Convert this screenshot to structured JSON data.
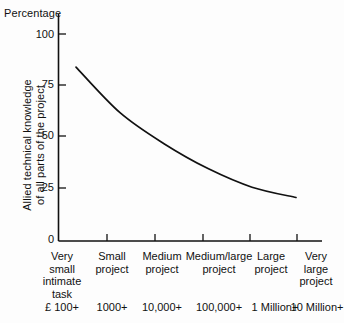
{
  "chart_data": {
    "type": "line",
    "title": "",
    "ylabel": "Allied technical knowledge of all parts of the project",
    "ylabel_lines": [
      "Allied technical knowledge",
      "of all parts of the project"
    ],
    "yunit_caption": "Percentage",
    "xlabel": "",
    "ylim": [
      0,
      100
    ],
    "yticks": [
      0,
      25,
      50,
      75,
      100
    ],
    "ytick_labels": [
      "0",
      "25",
      "50",
      "75",
      "100"
    ],
    "grid": false,
    "legend": "none",
    "categories": [
      "Very small intimate task",
      "Small project",
      "Medium project",
      "Medium/large project",
      "Large project",
      "Very large project"
    ],
    "category_lines": [
      [
        "Very",
        "small",
        "intimate",
        "task"
      ],
      [
        "Small",
        "project"
      ],
      [
        "Medium",
        "project"
      ],
      [
        "Medium/large",
        "project"
      ],
      [
        "Large",
        "project"
      ],
      [
        "Very",
        "large",
        "project"
      ]
    ],
    "cost_axis_labels": [
      "£  100+",
      "1000+",
      "10,000+",
      "100,000+",
      "1 Million+",
      "10 Million+"
    ],
    "values": [
      84,
      62,
      47,
      35,
      26,
      21
    ],
    "series": [
      {
        "name": "Allied technical knowledge",
        "values": [
          84,
          62,
          47,
          35,
          26,
          21
        ]
      }
    ],
    "line_color": "#111111"
  }
}
